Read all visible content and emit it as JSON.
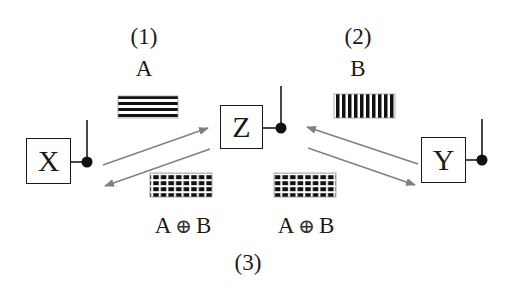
{
  "diagram": {
    "type": "xor-relay-key-exchange",
    "nodes": [
      {
        "id": "X",
        "label": "X"
      },
      {
        "id": "Z",
        "label": "Z"
      },
      {
        "id": "Y",
        "label": "Y"
      }
    ],
    "steps": {
      "step1": {
        "number": "(1)",
        "message": "A",
        "pattern": "horizontal-stripes"
      },
      "step2": {
        "number": "(2)",
        "message": "B",
        "pattern": "vertical-stripes"
      },
      "step3": {
        "number": "(3)",
        "message_left": {
          "a": "A",
          "op": "⊕",
          "b": "B"
        },
        "message_right": {
          "a": "A",
          "op": "⊕",
          "b": "B"
        },
        "pattern": "grid"
      }
    },
    "edges": [
      {
        "from": "X",
        "to": "Z"
      },
      {
        "from": "Z",
        "to": "X"
      },
      {
        "from": "Y",
        "to": "Z"
      },
      {
        "from": "Z",
        "to": "Y"
      }
    ],
    "colors": {
      "ink": "#1a1a1a",
      "arrow": "#808080",
      "background": "#ffffff"
    }
  }
}
